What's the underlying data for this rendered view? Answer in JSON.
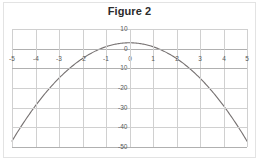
{
  "figure": {
    "title": "Figure 2",
    "border_color": "#e3e3e3",
    "background": "#ffffff"
  },
  "chart_data": {
    "type": "line",
    "title": "Figure 2",
    "xlabel": "",
    "ylabel": "",
    "xlim": [
      -5,
      5
    ],
    "ylim": [
      -50,
      10
    ],
    "grid": true,
    "legend": false,
    "legend_position": "none",
    "series_color": "#767171",
    "grid_color": "#d0d0d0",
    "axis_color": "#b0b0b0",
    "tick_label_color": "#595959",
    "xticks": [
      -5,
      -4,
      -3,
      -2,
      -1,
      0,
      1,
      2,
      3,
      4,
      5
    ],
    "xtick_labels": [
      "-5",
      "-4",
      "-3",
      "-2",
      "-1",
      "0",
      "1",
      "2",
      "3",
      "4",
      "5"
    ],
    "yticks": [
      10,
      0,
      -10,
      -20,
      -30,
      -40,
      -50
    ],
    "ytick_labels": [
      "10",
      "0",
      "-10",
      "-20",
      "-30",
      "-40",
      "-50"
    ],
    "equation": "y = 3 - 2x^2",
    "series": [
      {
        "name": "parabola",
        "x": [
          -5,
          -4.5,
          -4,
          -3.5,
          -3,
          -2.5,
          -2,
          -1.5,
          -1,
          -0.5,
          0,
          0.5,
          1,
          1.5,
          2,
          2.5,
          3,
          3.5,
          4,
          4.5,
          5
        ],
        "values": [
          -47,
          -37.5,
          -29,
          -21.5,
          -15,
          -9.5,
          -5,
          -1.5,
          1,
          2.5,
          3,
          2.5,
          1,
          -1.5,
          -5,
          -9.5,
          -15,
          -21.5,
          -29,
          -37.5,
          -47
        ]
      }
    ]
  }
}
